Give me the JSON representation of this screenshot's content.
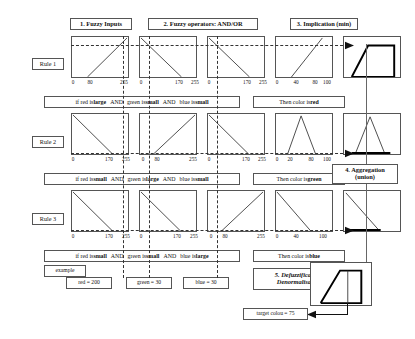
{
  "headers": {
    "step1": "1. Fuzzy Inputs",
    "step2": "2. Fuzzy operators: AND/OR",
    "step3": "3. Implication (min)",
    "step4_line1": "4. Aggregation",
    "step4_line2": "(union)",
    "step5_line1": "5. Defuzzification/",
    "step5_line2": "Denormalisation"
  },
  "rules": [
    {
      "label": "Rule 1",
      "antecedent": {
        "pre1": "if red is ",
        "term1": "large",
        "op1": "AND",
        "pre2": "green is ",
        "term2": "small",
        "op2": "AND",
        "pre3": "blue is ",
        "term3": "small"
      },
      "consequent": {
        "pre": "Then color is ",
        "term": "red"
      },
      "inputs": [
        {
          "var": "red",
          "shape": "up",
          "ticks": [
            "0",
            "80",
            "255"
          ],
          "tickpos": [
            0,
            31,
            100
          ]
        },
        {
          "var": "green",
          "shape": "down",
          "ticks": [
            "0",
            "170",
            "255"
          ],
          "tickpos": [
            0,
            67,
            100
          ]
        },
        {
          "var": "blue",
          "shape": "down",
          "ticks": [
            "0",
            "170",
            "255"
          ],
          "tickpos": [
            0,
            67,
            100
          ]
        }
      ],
      "output": {
        "shape": "up",
        "ticks": [
          "0",
          "40",
          "80",
          "100"
        ],
        "tickpos": [
          0,
          40,
          80,
          100
        ]
      },
      "implication": {
        "shape": "trapezoid-right",
        "activation": 0.78
      }
    },
    {
      "label": "Rule 2",
      "antecedent": {
        "pre1": "if red is ",
        "term1": "small",
        "op1": "AND",
        "pre2": "green is ",
        "term2": "large",
        "op2": "AND",
        "pre3": "blue is ",
        "term3": "small"
      },
      "consequent": {
        "pre": "Then color is ",
        "term": "green"
      },
      "inputs": [
        {
          "var": "red",
          "shape": "down",
          "ticks": [
            "0",
            "170",
            "255"
          ],
          "tickpos": [
            0,
            67,
            100
          ]
        },
        {
          "var": "green",
          "shape": "up",
          "ticks": [
            "0",
            "80",
            "255"
          ],
          "tickpos": [
            0,
            31,
            100
          ]
        },
        {
          "var": "blue",
          "shape": "down",
          "ticks": [
            "0",
            "170",
            "255"
          ],
          "tickpos": [
            0,
            67,
            100
          ]
        }
      ],
      "output": {
        "shape": "triangle",
        "ticks": [
          "0",
          "20",
          "80",
          "100"
        ],
        "tickpos": [
          0,
          20,
          80,
          100
        ]
      },
      "implication": {
        "shape": "triangle-zero",
        "activation": 0.0
      }
    },
    {
      "label": "Rule 3",
      "antecedent": {
        "pre1": "if red is ",
        "term1": "small",
        "op1": "AND",
        "pre2": "green is ",
        "term2": "small",
        "op2": "AND",
        "pre3": "blue is ",
        "term3": "large"
      },
      "consequent": {
        "pre": "Then color is ",
        "term": "blue"
      },
      "inputs": [
        {
          "var": "red",
          "shape": "down",
          "ticks": [
            "0",
            "170",
            "255"
          ],
          "tickpos": [
            0,
            67,
            100
          ]
        },
        {
          "var": "green",
          "shape": "down",
          "ticks": [
            "0",
            "170",
            "255"
          ],
          "tickpos": [
            0,
            67,
            100
          ]
        },
        {
          "var": "blue",
          "shape": "up",
          "ticks": [
            "0",
            "80",
            "255"
          ],
          "tickpos": [
            0,
            31,
            100
          ]
        }
      ],
      "output": {
        "shape": "down",
        "ticks": [
          "0",
          "40",
          "100"
        ],
        "tickpos": [
          0,
          40,
          100
        ]
      },
      "implication": {
        "shape": "ramp-down-zero",
        "activation": 0.0
      }
    }
  ],
  "example": {
    "label": "example",
    "red": "red = 200",
    "green": "green = 30",
    "blue": "blue = 30"
  },
  "result": {
    "target": "target colou  =  75"
  },
  "colors": {
    "line": "#333333",
    "box_border": "#555555",
    "emphasis": "#000000",
    "background": "#ffffff"
  }
}
